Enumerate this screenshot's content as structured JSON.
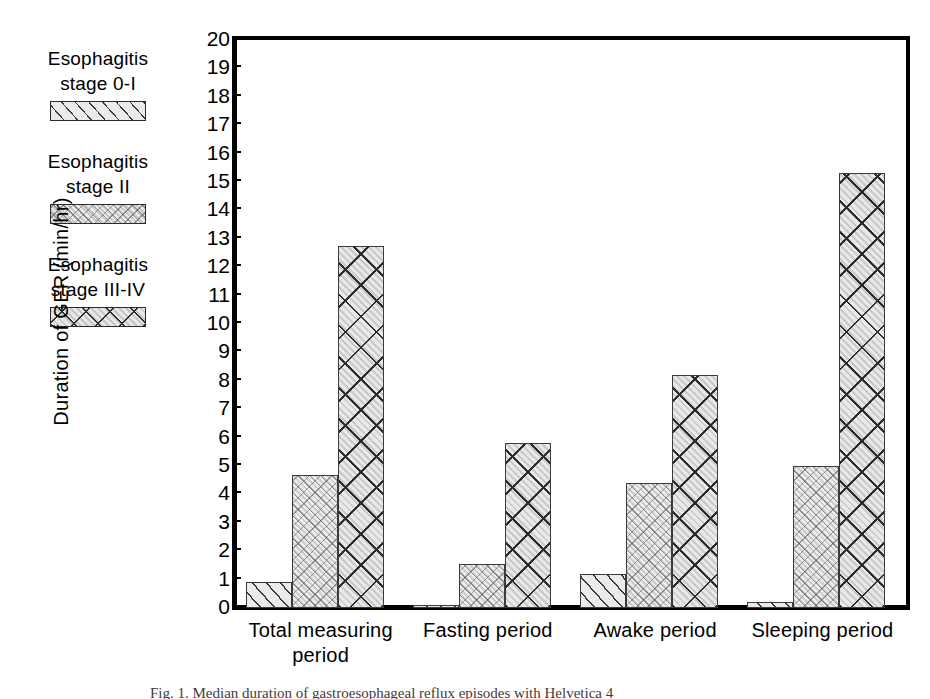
{
  "legend": {
    "items": [
      {
        "line1": "Esophagitis",
        "line2": "stage 0-I",
        "pattern": "diagonal-hatch",
        "swatch_name": "legend-swatch-stage-0-I"
      },
      {
        "line1": "Esophagitis",
        "line2": "stage II",
        "pattern": "stipple-crosshatch",
        "swatch_name": "legend-swatch-stage-II"
      },
      {
        "line1": "Esophagitis",
        "line2": "stage III-IV",
        "pattern": "diamond-lattice",
        "swatch_name": "legend-swatch-stage-III-IV"
      }
    ]
  },
  "axis": {
    "y_title": "Duration of GER (min/hr)",
    "y_ticks": [
      "20",
      "19",
      "18",
      "17",
      "16",
      "15",
      "14",
      "13",
      "12",
      "11",
      "10",
      "9",
      "8",
      "7",
      "6",
      "5",
      "4",
      "3",
      "2",
      "1",
      "0"
    ]
  },
  "x_labels": [
    {
      "line1": "Total measuring",
      "line2": "period"
    },
    {
      "line1": "Fasting period",
      "line2": ""
    },
    {
      "line1": "Awake period",
      "line2": ""
    },
    {
      "line1": "Sleeping period",
      "line2": ""
    }
  ],
  "caption": "Fig. 1. Median duration of gastroesophageal reflux episodes with Helvetica 4",
  "colors": {
    "axis": "#000000",
    "bar_fill": "#ecebeb",
    "bar_edge": "#3b3b3b",
    "background": "#ffffff"
  },
  "chart_data": {
    "type": "bar",
    "title": "",
    "xlabel": "",
    "ylabel": "Duration of GER (min/hr)",
    "ylim": [
      0,
      20
    ],
    "ytick_step": 1,
    "grid": false,
    "legend_position": "outside-left",
    "categories": [
      "Total measuring period",
      "Fasting period",
      "Awake period",
      "Sleeping period"
    ],
    "series": [
      {
        "name": "Esophagitis stage 0-I",
        "pattern": "diagonal-hatch",
        "values": [
          0.9,
          0.1,
          1.2,
          0.2
        ]
      },
      {
        "name": "Esophagitis stage II",
        "pattern": "stipple-crosshatch",
        "values": [
          4.7,
          1.55,
          4.4,
          5.0
        ]
      },
      {
        "name": "Esophagitis stage III-IV",
        "pattern": "diamond-lattice",
        "values": [
          12.75,
          5.8,
          8.2,
          15.3
        ]
      }
    ]
  }
}
